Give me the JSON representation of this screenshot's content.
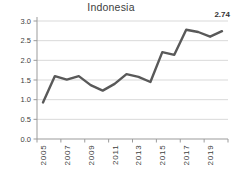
{
  "colors": {
    "background": "#ffffff",
    "line": "#595959",
    "grid": "#d9d9d9",
    "axis": "#9b9b9b",
    "tick_text": "#404040",
    "title_text": "#3d3d3d",
    "label_text": "#333333"
  },
  "chart_data": {
    "type": "line",
    "title": "Indonesia",
    "series_name": "Indonesia",
    "x": [
      2005,
      2006,
      2007,
      2008,
      2009,
      2010,
      2011,
      2012,
      2013,
      2014,
      2015,
      2016,
      2017,
      2018,
      2019,
      2020
    ],
    "values": [
      0.93,
      1.6,
      1.51,
      1.6,
      1.37,
      1.23,
      1.4,
      1.65,
      1.58,
      1.45,
      2.21,
      2.14,
      2.78,
      2.72,
      2.6,
      2.74
    ],
    "x_tick_labels": [
      "2005",
      "2007",
      "2009",
      "2011",
      "2013",
      "2015",
      "2017",
      "2019"
    ],
    "x_tick_label_interval": 2,
    "y_ticks": [
      0,
      0.5,
      1,
      1.5,
      2,
      2.5,
      3
    ],
    "y_tick_labels": [
      "0.0",
      "0.5",
      "1.0",
      "1.5",
      "2.0",
      "2.5",
      "3.0"
    ],
    "ylim": [
      0,
      3
    ],
    "grid": "horizontal",
    "legend": "none",
    "last_point_label": "2.74"
  }
}
